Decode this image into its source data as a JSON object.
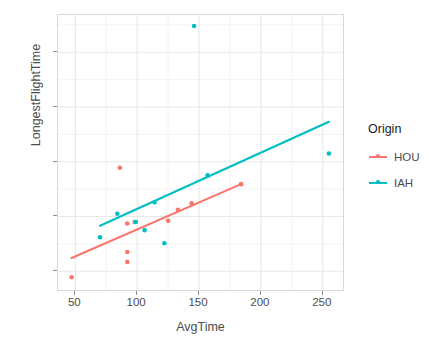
{
  "chart_data": {
    "type": "scatter",
    "title": "",
    "xlabel": "AvgTime",
    "ylabel": "LongestFlightTime",
    "xlim": [
      36,
      268
    ],
    "ylim": [
      62,
      568
    ],
    "xticks": [
      50,
      100,
      150,
      200,
      250
    ],
    "yticks": [
      100,
      200,
      300,
      400,
      500
    ],
    "grid": true,
    "legend": {
      "title": "Origin",
      "position": "right",
      "entries": [
        {
          "name": "HOU",
          "color": "#F8766D"
        },
        {
          "name": "IAH",
          "color": "#00BFC4"
        }
      ]
    },
    "series": [
      {
        "name": "HOU",
        "color": "#F8766D",
        "points": [
          {
            "x": 47,
            "y": 89
          },
          {
            "x": 86,
            "y": 289
          },
          {
            "x": 92,
            "y": 187
          },
          {
            "x": 92,
            "y": 135
          },
          {
            "x": 92,
            "y": 117
          },
          {
            "x": 98,
            "y": 190
          },
          {
            "x": 125,
            "y": 192
          },
          {
            "x": 133,
            "y": 212
          },
          {
            "x": 144,
            "y": 224
          },
          {
            "x": 184,
            "y": 259
          }
        ],
        "fit": {
          "x0": 47,
          "y0": 124,
          "x1": 184,
          "y1": 259
        }
      },
      {
        "name": "IAH",
        "color": "#00BFC4",
        "points": [
          {
            "x": 70,
            "y": 162
          },
          {
            "x": 84,
            "y": 205
          },
          {
            "x": 99,
            "y": 190
          },
          {
            "x": 106,
            "y": 175
          },
          {
            "x": 114,
            "y": 226
          },
          {
            "x": 122,
            "y": 151
          },
          {
            "x": 146,
            "y": 548
          },
          {
            "x": 157,
            "y": 275
          },
          {
            "x": 255,
            "y": 315
          }
        ],
        "fit": {
          "x0": 70,
          "y0": 183,
          "x1": 255,
          "y1": 373
        }
      }
    ]
  }
}
